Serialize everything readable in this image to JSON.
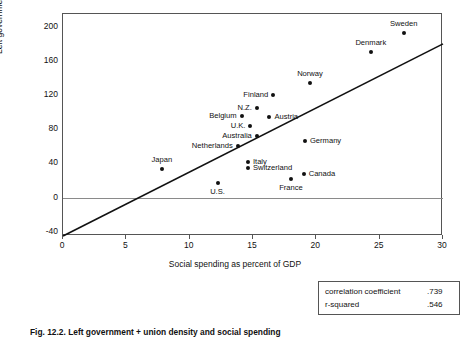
{
  "chart_data": {
    "type": "scatter",
    "title": "",
    "xlabel": "Social spending as percent of GDP",
    "ylabel": "Left government+union density",
    "xlim": [
      0,
      30
    ],
    "ylim": [
      -45,
      215
    ],
    "xticks": [
      0,
      5,
      10,
      15,
      20,
      25,
      30
    ],
    "yticks": [
      -40,
      0,
      40,
      80,
      120,
      160,
      200
    ],
    "grid": false,
    "legend": "none",
    "points": [
      {
        "label": "Sweden",
        "x": 26.9,
        "y": 193,
        "label_pos": "above"
      },
      {
        "label": "Denmark",
        "x": 24.3,
        "y": 170,
        "label_pos": "above"
      },
      {
        "label": "Norway",
        "x": 19.5,
        "y": 134,
        "label_pos": "above"
      },
      {
        "label": "Finland",
        "x": 16.6,
        "y": 120,
        "label_pos": "left"
      },
      {
        "label": "N.Z.",
        "x": 15.3,
        "y": 105,
        "label_pos": "left"
      },
      {
        "label": "Belgium",
        "x": 14.1,
        "y": 95,
        "label_pos": "left"
      },
      {
        "label": "Austria",
        "x": 16.3,
        "y": 94,
        "label_pos": "right"
      },
      {
        "label": "U.K.",
        "x": 14.8,
        "y": 84,
        "label_pos": "left"
      },
      {
        "label": "Australia",
        "x": 15.3,
        "y": 72,
        "label_pos": "left"
      },
      {
        "label": "Germany",
        "x": 19.1,
        "y": 66,
        "label_pos": "right"
      },
      {
        "label": "Netherlands",
        "x": 13.8,
        "y": 60,
        "label_pos": "left"
      },
      {
        "label": "Italy",
        "x": 14.6,
        "y": 42,
        "label_pos": "right"
      },
      {
        "label": "Switzerland",
        "x": 14.6,
        "y": 35,
        "label_pos": "right"
      },
      {
        "label": "Japan",
        "x": 7.8,
        "y": 33,
        "label_pos": "above"
      },
      {
        "label": "Canada",
        "x": 19.0,
        "y": 28,
        "label_pos": "right"
      },
      {
        "label": "France",
        "x": 18.0,
        "y": 22,
        "label_pos": "below"
      },
      {
        "label": "U.S.",
        "x": 12.2,
        "y": 17,
        "label_pos": "below"
      }
    ],
    "trendline": {
      "x0": 0,
      "y0": -45,
      "x1": 30,
      "y1": 180
    }
  },
  "axes": {
    "y_title": "Left government+union density",
    "x_title": "Social spending as percent of GDP",
    "y_tick_labels": [
      "200",
      "160",
      "120",
      "80",
      "40",
      "0",
      "-40"
    ],
    "x_tick_labels": [
      "0",
      "5",
      "10",
      "15",
      "20",
      "25",
      "30"
    ]
  },
  "stats_box": {
    "rows": [
      {
        "name": "correlation coefficient",
        "value": ".739"
      },
      {
        "name": "r-squared",
        "value": ".546"
      }
    ]
  },
  "caption": {
    "label": "Fig. 12.2.",
    "text": "Left government + union density and social spending"
  }
}
